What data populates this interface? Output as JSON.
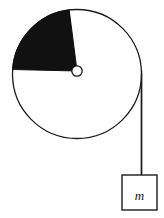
{
  "figure": {
    "background_color": "#ffffff",
    "stroke_color": "#1a1a1a",
    "fill_color": "#111111",
    "white": "#ffffff"
  },
  "disk": {
    "name": "pulley-disk",
    "center_x": 77,
    "center_y": 74,
    "radius": 64.5,
    "stroke_width": 1.3,
    "fill": "#ffffff",
    "stroke": "#1a1a1a"
  },
  "sector": {
    "name": "shaded-sector",
    "description": "solid black circular sector of the disk",
    "start_angle_deg": 184,
    "end_angle_deg": 263,
    "fill": "#111111",
    "stroke": "#111111"
  },
  "hub": {
    "name": "axle-hub",
    "center_x": 77,
    "center_y": 71,
    "radius": 5.2,
    "fill": "#ffffff",
    "stroke": "#1a1a1a",
    "stroke_width": 1.3
  },
  "cord": {
    "name": "cord",
    "x": 141.5,
    "y_top": 74,
    "y_bottom": 175,
    "stroke": "#1a1a1a",
    "stroke_width": 1.4
  },
  "mass_box": {
    "name": "hanging-mass-box",
    "x": 122,
    "y": 175,
    "width": 35,
    "height": 35,
    "fill": "#ffffff",
    "stroke": "#1a1a1a",
    "stroke_width": 1.4,
    "label": "m",
    "label_x": 139.5,
    "label_y": 197.5
  }
}
